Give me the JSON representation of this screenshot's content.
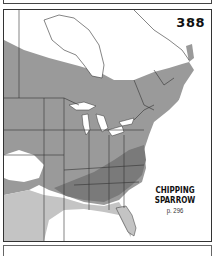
{
  "map": {
    "plate_number": "388",
    "species_name_line1": "CHIPPING",
    "species_name_line2": "SPARROW",
    "page_reference": "p. 296",
    "colors": {
      "breeding_range": "#9a9a9a",
      "year_round_range": "#7a7a7a",
      "winter_range": "#c4c4c4",
      "land_outside_range": "#ffffff",
      "water": "#ffffff",
      "borders": "#333333"
    },
    "legend_regions": [
      "breeding",
      "year-round",
      "winter"
    ]
  }
}
